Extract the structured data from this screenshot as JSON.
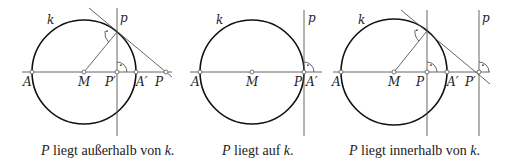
{
  "panels": [
    {
      "caption": {
        "var": "P",
        "text": " liegt außerhalb von ",
        "var2": "k",
        "end": "."
      },
      "labels": {
        "k": "k",
        "p": "p",
        "A": "A",
        "M": "M",
        "P_prime": "P′",
        "A_prime": "A′",
        "P": "P"
      },
      "right_angle_mark": "·"
    },
    {
      "caption": {
        "var": "P",
        "text": " liegt auf ",
        "var2": "k",
        "end": "."
      },
      "labels": {
        "k": "k",
        "p": "p",
        "A": "A",
        "M": "M",
        "P": "P",
        "A_prime": "A′"
      },
      "right_angle_mark": "·"
    },
    {
      "caption": {
        "var": "P",
        "text": " liegt innerhalb von ",
        "var2": "k",
        "end": "."
      },
      "labels": {
        "k": "k",
        "p": "p",
        "A": "A",
        "M": "M",
        "P": "P",
        "A_prime": "A′",
        "P_prime": "P′"
      },
      "right_angle_mark": "·"
    }
  ],
  "colors": {
    "circle": "#111111",
    "lines": "#555555",
    "text": "#222222"
  }
}
